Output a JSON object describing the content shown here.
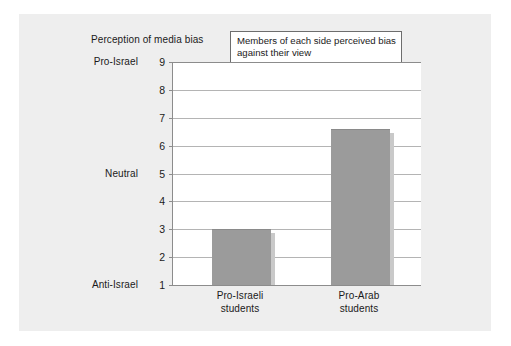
{
  "figure": {
    "background_color": "#ffffff",
    "panel_color": "#eeeeee"
  },
  "annotation": {
    "text": "Members of each side perceived bias against their view",
    "border_color": "#6d6d6d"
  },
  "chart_data": {
    "type": "bar",
    "title": "Perception of media bias",
    "xlabel": "",
    "ylabel": "",
    "categories": [
      "Pro-Israeli students",
      "Pro-Arab students"
    ],
    "category_lines": [
      [
        "Pro-Israeli",
        "students"
      ],
      [
        "Pro-Arab",
        "students"
      ]
    ],
    "values": [
      3.0,
      6.6
    ],
    "ylim": [
      1,
      9
    ],
    "yticks": [
      1,
      2,
      3,
      4,
      5,
      6,
      7,
      8,
      9
    ],
    "ytick_labels": [
      "1",
      "2",
      "3",
      "4",
      "5",
      "6",
      "7",
      "8",
      "9"
    ],
    "y_anchor_labels": [
      {
        "value": 9,
        "label": "Pro-Israel"
      },
      {
        "value": 5,
        "label": "Neutral"
      },
      {
        "value": 1,
        "label": "Anti-Israel"
      }
    ],
    "grid": true,
    "legend": false,
    "bar_color": "#9b9b9b",
    "gridline_color": "#b4b4b4",
    "axis_color": "#8c8c8c",
    "annotation_text": "Members of each side perceived bias against their view"
  }
}
